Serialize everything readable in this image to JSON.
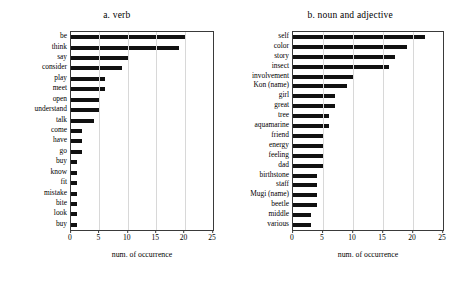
{
  "figure": {
    "background": "#ffffff",
    "bar_color": "#111111",
    "axis_color": "#3a3a3a",
    "grid_color": "#d8d8d8"
  },
  "chart_data": [
    {
      "type": "bar",
      "orientation": "horizontal",
      "title": "a. verb",
      "xlabel": "num. of occurrence",
      "ylabel": "",
      "xlim": [
        0,
        25
      ],
      "xticks": [
        0,
        5,
        10,
        15,
        20,
        25
      ],
      "grid": true,
      "legend": null,
      "categories": [
        "be",
        "think",
        "say",
        "consider",
        "play",
        "meet",
        "open",
        "understand",
        "talk",
        "come",
        "have",
        "go",
        "buy",
        "know",
        "fit",
        "mistake",
        "bite",
        "look",
        "buy"
      ],
      "values": [
        20,
        19,
        10,
        9,
        6,
        6,
        5,
        5,
        4,
        2,
        2,
        2,
        1,
        1,
        1,
        1,
        1,
        1,
        1
      ]
    },
    {
      "type": "bar",
      "orientation": "horizontal",
      "title": "b. noun and adjective",
      "xlabel": "num. of occurrence",
      "ylabel": "",
      "xlim": [
        0,
        25
      ],
      "xticks": [
        0,
        5,
        10,
        15,
        20,
        25
      ],
      "grid": true,
      "legend": null,
      "categories": [
        "self",
        "color",
        "story",
        "insect",
        "involvement",
        "Kon (name)",
        "girl",
        "great",
        "tree",
        "aquamarine",
        "friend",
        "energy",
        "feeling",
        "dad",
        "birthstone",
        "staff",
        "Mugi (name)",
        "beetle",
        "middle",
        "various"
      ],
      "values": [
        22,
        19,
        17,
        16,
        10,
        9,
        7,
        7,
        6,
        6,
        5,
        5,
        5,
        5,
        4,
        4,
        4,
        4,
        3,
        3
      ]
    }
  ]
}
